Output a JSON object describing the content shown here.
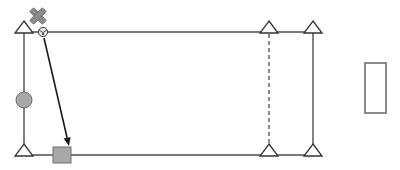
{
  "canvas": {
    "width": 400,
    "height": 170,
    "background": "#ffffff",
    "title": "structural-frame-diagram"
  },
  "palette": {
    "stroke": "#4d4d4d",
    "stroke_dark": "#333333",
    "fill_white": "#ffffff",
    "gray_fill": "#a8a8a8",
    "gray_fill_light": "#b0b0b0",
    "marker_gray": "#8c8c8c",
    "arrow_black": "#1a1a1a",
    "rect_border": "#6e6e6e"
  },
  "geometry": {
    "frame": {
      "left_x": 24,
      "right_x": 313,
      "top_y": 32,
      "bottom_y": 155,
      "stroke_width": 1.4
    },
    "dashed_column_x": 269,
    "dash_pattern": "4 3"
  },
  "nodes": [
    {
      "id": "node-top-left",
      "label": "Top Left Support",
      "x": 24,
      "y": 32,
      "type": "triangle-support",
      "size": 11
    },
    {
      "id": "node-bottom-left",
      "label": "Bottom Left Support",
      "x": 24,
      "y": 155,
      "type": "triangle-support",
      "size": 11
    },
    {
      "id": "node-top-mid",
      "label": "Top Middle Support",
      "x": 269,
      "y": 32,
      "type": "triangle-support",
      "size": 11
    },
    {
      "id": "node-bottom-mid",
      "label": "Bottom Middle Support",
      "x": 269,
      "y": 155,
      "type": "triangle-support",
      "size": 11
    },
    {
      "id": "node-top-right",
      "label": "Top Right Support",
      "x": 313,
      "y": 32,
      "type": "triangle-support",
      "size": 11
    },
    {
      "id": "node-bottom-right",
      "label": "Bottom Right Support",
      "x": 313,
      "y": 155,
      "type": "triangle-support",
      "size": 11
    }
  ],
  "markers": {
    "cross": {
      "label": "Delete Marker",
      "x": 38,
      "y": 16,
      "arm": 9,
      "thickness": 5.5,
      "rotation": 45
    },
    "ball": {
      "label": "Small Ball Handle",
      "x": 43,
      "y": 32,
      "radius": 4.5
    },
    "circle_handle": {
      "label": "Circular Joint",
      "x": 24,
      "y": 100,
      "radius": 8
    },
    "square_handle": {
      "label": "Square Joint",
      "x": 62,
      "y": 155,
      "width": 18,
      "height": 16
    }
  },
  "arrow": {
    "label": "Drag Arrow",
    "x1": 44,
    "y1": 38,
    "x2": 69,
    "y2": 146,
    "head_size": 5,
    "stroke_width": 1.6
  },
  "detached_rect": {
    "label": "Detached Panel",
    "x": 365,
    "y": 63,
    "width": 21,
    "height": 50,
    "stroke_width": 1.6
  },
  "chart_data": {
    "type": "diagram",
    "elements": [
      "left-column",
      "top-beam",
      "bottom-beam",
      "right-column",
      "dashed-mid-column",
      "diagonal-arrow",
      "detached-rectangle"
    ]
  }
}
